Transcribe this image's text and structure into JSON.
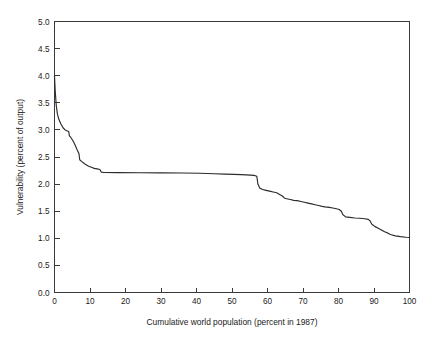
{
  "chart_data": {
    "type": "line",
    "title": "",
    "subtitle": "",
    "xlabel": "Cumulative world population (percent in 1987)",
    "ylabel": "Vulnerability (percent of output)",
    "xlim": [
      0,
      100
    ],
    "ylim": [
      0,
      5
    ],
    "xticks": [
      0,
      10,
      20,
      30,
      40,
      50,
      60,
      70,
      80,
      90,
      100
    ],
    "xtick_labels": [
      "0",
      "10",
      "20",
      "30",
      "40",
      "50",
      "60",
      "70",
      "80",
      "90",
      "100"
    ],
    "yticks": [
      0.0,
      0.5,
      1.0,
      1.5,
      2.0,
      2.5,
      3.0,
      3.5,
      4.0,
      4.5,
      5.0
    ],
    "ytick_labels": [
      "0.0",
      "0.5",
      "1.0",
      "1.5",
      "2.0",
      "2.5",
      "3.0",
      "3.5",
      "4.0",
      "4.5",
      "5.0"
    ],
    "grid": false,
    "legend": null,
    "legend_position": "none",
    "annotations": [],
    "series": [
      {
        "name": "Vulnerability curve",
        "color": "#2b2b2b",
        "x": [
          0.0,
          0.2,
          0.5,
          0.8,
          1.2,
          1.8,
          2.4,
          3.0,
          3.6,
          4.0,
          4.2,
          4.6,
          5.2,
          5.8,
          6.4,
          6.9,
          7.1,
          7.6,
          8.2,
          8.8,
          9.6,
          10.4,
          11.2,
          12.0,
          12.8,
          13.2,
          14.0,
          18.0,
          24.0,
          30.0,
          36.0,
          41.0,
          45.0,
          48.0,
          50.5,
          52.5,
          54.0,
          55.2,
          56.2,
          56.8,
          57.0,
          57.3,
          57.8,
          58.6,
          59.6,
          60.6,
          61.6,
          62.6,
          63.4,
          64.2,
          64.8,
          65.4,
          66.4,
          67.4,
          68.4,
          69.4,
          70.4,
          71.4,
          72.4,
          73.4,
          74.4,
          75.4,
          76.2,
          76.8,
          77.4,
          78.4,
          79.4,
          80.2,
          80.8,
          81.2,
          82.0,
          83.2,
          84.6,
          86.0,
          87.4,
          88.4,
          88.9,
          89.4,
          90.2,
          91.2,
          92.2,
          93.0,
          93.8,
          94.6,
          96.0,
          97.5,
          99.0,
          100.0
        ],
        "y": [
          4.0,
          3.72,
          3.45,
          3.3,
          3.2,
          3.11,
          3.04,
          3.0,
          2.98,
          2.97,
          2.89,
          2.86,
          2.8,
          2.72,
          2.63,
          2.56,
          2.45,
          2.42,
          2.39,
          2.36,
          2.33,
          2.31,
          2.29,
          2.28,
          2.27,
          2.22,
          2.215,
          2.213,
          2.21,
          2.208,
          2.205,
          2.2,
          2.19,
          2.185,
          2.18,
          2.175,
          2.17,
          2.165,
          2.16,
          2.15,
          2.14,
          2.0,
          1.93,
          1.9,
          1.885,
          1.87,
          1.855,
          1.84,
          1.81,
          1.78,
          1.74,
          1.73,
          1.715,
          1.7,
          1.695,
          1.68,
          1.665,
          1.65,
          1.635,
          1.62,
          1.605,
          1.59,
          1.58,
          1.575,
          1.57,
          1.56,
          1.545,
          1.53,
          1.5,
          1.44,
          1.395,
          1.385,
          1.375,
          1.37,
          1.36,
          1.35,
          1.32,
          1.26,
          1.22,
          1.185,
          1.15,
          1.12,
          1.1,
          1.07,
          1.045,
          1.03,
          1.02,
          1.015
        ]
      }
    ]
  },
  "figure": {
    "background_color": "#ffffff",
    "axis_color": "#3a3a3a",
    "text_color": "#1a1a1a"
  }
}
